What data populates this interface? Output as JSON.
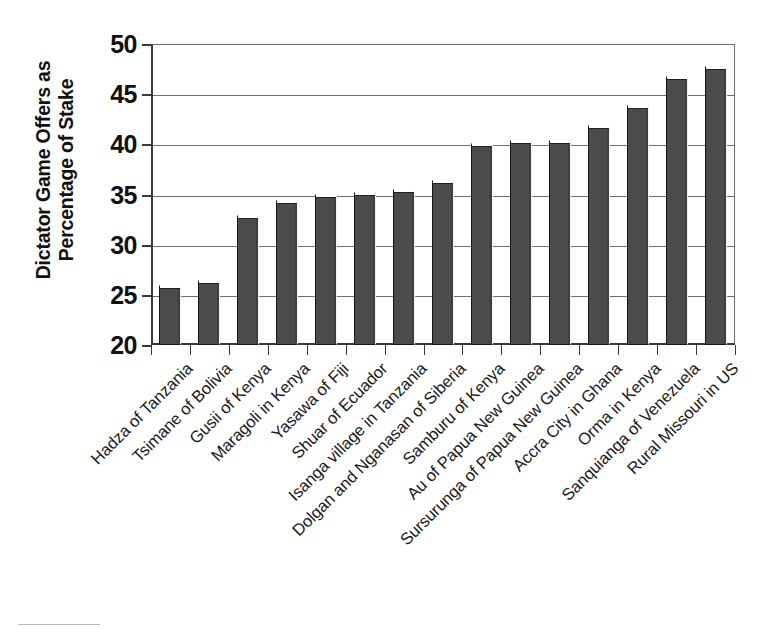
{
  "chart_data": {
    "type": "bar",
    "title": "",
    "xlabel": "",
    "ylabel": "Dictator Game Offers as Percentage of Stake",
    "ylabel_lines": [
      "Dictator Game Offers as",
      "Percentage of Stake"
    ],
    "ylim": [
      20,
      50
    ],
    "ytick_labels": [
      "50",
      "45",
      "40",
      "35",
      "30",
      "25",
      "20"
    ],
    "yticks": [
      50,
      45,
      40,
      35,
      30,
      25,
      20
    ],
    "grid": "horizontal",
    "legend": "none",
    "bar_color": "#4b4b4b",
    "bar_edge_color": "#151515",
    "axis_color": "#3a3a3a",
    "gridline_color": "#6e6e6e",
    "background": "#ffffff",
    "categories": [
      "Hadza of Tanzania",
      "Tsimane of Bolivia",
      "Gusii of Kenya",
      "Maragoli in Kenya",
      "Yasawa of Fiji",
      "Shuar of Ecuador",
      "Isanga village in Tanzania",
      "Dolgan and Nganasan of Siberia",
      "Samburu of Kenya",
      "Au of Papua New Guinea",
      "Sursurunga of Papua New Guinea",
      "Accra City in Ghana",
      "Orma in Kenya",
      "Sanquianga of Venezuela",
      "Rural Missouri in US"
    ],
    "values": [
      26.0,
      26.5,
      33.0,
      34.5,
      35.1,
      35.3,
      35.5,
      36.4,
      40.1,
      40.4,
      40.4,
      41.9,
      43.9,
      46.8,
      47.8
    ]
  }
}
